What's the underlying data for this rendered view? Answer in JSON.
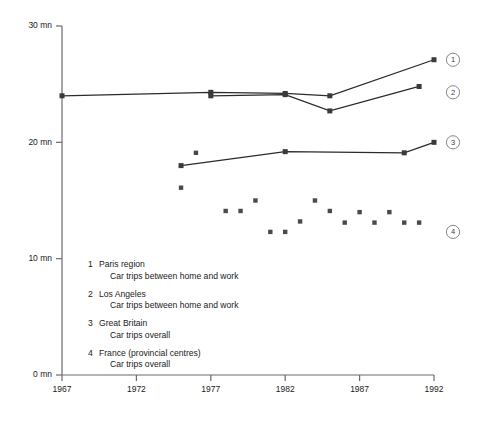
{
  "chart_data": {
    "type": "line",
    "title": "",
    "xlabel": "",
    "ylabel": "",
    "xlim": [
      1967,
      1992
    ],
    "ylim": [
      0,
      30
    ],
    "xticks": [
      1967,
      1972,
      1977,
      1982,
      1987,
      1992
    ],
    "xticklabels": [
      "1967",
      "1972",
      "1977",
      "1982",
      "1987",
      "1992"
    ],
    "yticks": [
      0,
      10,
      20,
      30
    ],
    "yticklabels": [
      "0 mn",
      "10 mn",
      "20 mn",
      "30 mn"
    ],
    "grid": false,
    "legend_position": "inside-lower-left",
    "unit": "mn",
    "series": [
      {
        "id": "1",
        "name": "Paris region",
        "subtitle": "Car trips between home and work",
        "mode": "line+markers",
        "callout": "1",
        "points": [
          {
            "x": 1967,
            "y": 24.0
          },
          {
            "x": 1977,
            "y": 24.3
          },
          {
            "x": 1982,
            "y": 24.2
          },
          {
            "x": 1985,
            "y": 24.0
          },
          {
            "x": 1992,
            "y": 27.1
          }
        ]
      },
      {
        "id": "2",
        "name": "Los Angeles",
        "subtitle": "Car trips between home and work",
        "mode": "line+markers",
        "callout": "2",
        "points": [
          {
            "x": 1977,
            "y": 24.0
          },
          {
            "x": 1982,
            "y": 24.1
          },
          {
            "x": 1985,
            "y": 22.7
          },
          {
            "x": 1991,
            "y": 24.8
          }
        ]
      },
      {
        "id": "3",
        "name": "Great Britain",
        "subtitle": "Car trips overall",
        "mode": "line+markers",
        "callout": "3",
        "points": [
          {
            "x": 1975,
            "y": 18.0
          },
          {
            "x": 1982,
            "y": 19.2
          },
          {
            "x": 1990,
            "y": 19.1
          },
          {
            "x": 1992,
            "y": 20.0
          }
        ]
      },
      {
        "id": "4",
        "name": "France (provincial centres)",
        "subtitle": "Car trips overall",
        "mode": "markers",
        "callout": "4",
        "points": [
          {
            "x": 1975,
            "y": 16.1
          },
          {
            "x": 1976,
            "y": 19.1
          },
          {
            "x": 1978,
            "y": 14.1
          },
          {
            "x": 1979,
            "y": 14.1
          },
          {
            "x": 1980,
            "y": 15.0
          },
          {
            "x": 1981,
            "y": 12.3
          },
          {
            "x": 1982,
            "y": 12.3
          },
          {
            "x": 1983,
            "y": 13.2
          },
          {
            "x": 1984,
            "y": 15.0
          },
          {
            "x": 1985,
            "y": 14.1
          },
          {
            "x": 1986,
            "y": 13.1
          },
          {
            "x": 1987,
            "y": 14.0
          },
          {
            "x": 1988,
            "y": 13.1
          },
          {
            "x": 1989,
            "y": 14.0
          },
          {
            "x": 1990,
            "y": 13.1
          },
          {
            "x": 1991,
            "y": 13.1
          }
        ]
      }
    ]
  },
  "legend": {
    "entries": [
      {
        "num": "1",
        "name": "Paris region",
        "detail": "Car trips between home and work"
      },
      {
        "num": "2",
        "name": "Los Angeles",
        "detail": "Car trips between home and work"
      },
      {
        "num": "3",
        "name": "Great Britain",
        "detail": "Car trips overall"
      },
      {
        "num": "4",
        "name": "France (provincial centres)",
        "detail": "Car trips overall"
      }
    ]
  },
  "callouts": [
    {
      "label": "1",
      "y_value": 27.1
    },
    {
      "label": "2",
      "y_value": 24.3
    },
    {
      "label": "3",
      "y_value": 20.0
    },
    {
      "label": "4",
      "y_value": 12.3
    }
  ],
  "colors": {
    "background": "#ffffff",
    "axis": "#6b6b6b",
    "line": "#2b2b2b",
    "marker": "#3a3a3a",
    "scatter_marker": "#4a4a4a",
    "text": "#1a1a1a",
    "callout_ring": "#777777"
  }
}
